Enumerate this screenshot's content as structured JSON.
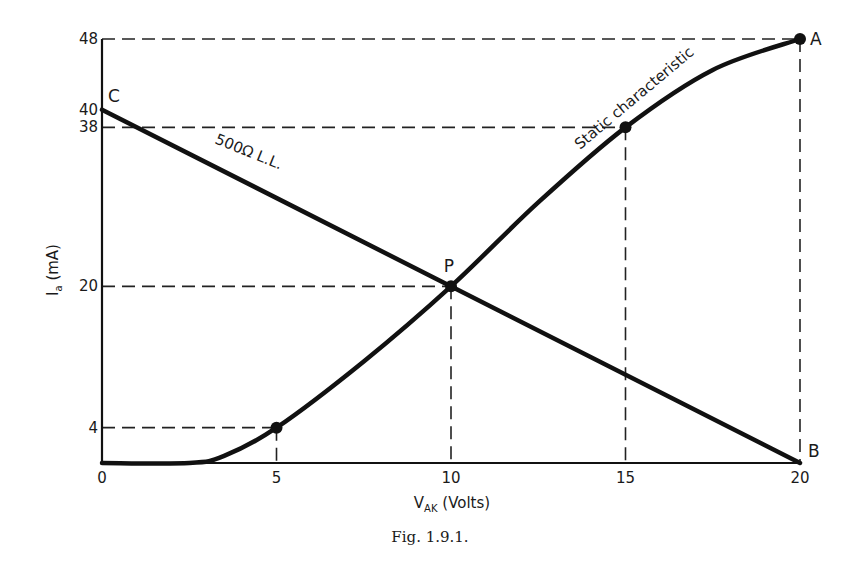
{
  "chart_data": {
    "type": "line",
    "title": "",
    "caption": "Fig. 1.9.1.",
    "xlabel": {
      "main": "V",
      "sub": "AK",
      "unit": " (Volts)"
    },
    "ylabel": {
      "main": "I",
      "sub": "a",
      "unit": " (mA)"
    },
    "xlim": [
      0,
      20
    ],
    "ylim": [
      0,
      48
    ],
    "grid": false,
    "x_ticks": [
      0,
      5,
      10,
      15,
      20
    ],
    "y_ticks": [
      4,
      20,
      38,
      40,
      48
    ],
    "series": [
      {
        "name": "Static characteristic",
        "label": "Static characteristic",
        "x": [
          0,
          2.5,
          3.5,
          5,
          7.5,
          10,
          12.5,
          15,
          17.5,
          20
        ],
        "y": [
          0,
          0,
          0.8,
          4,
          11.5,
          20,
          29.5,
          38,
          44.5,
          48
        ]
      },
      {
        "name": "Load line",
        "label": "500Ω L.L.",
        "x": [
          0,
          20
        ],
        "y": [
          40,
          0
        ]
      }
    ],
    "marked_points": [
      {
        "x": 5,
        "y": 4,
        "label": ""
      },
      {
        "x": 10,
        "y": 20,
        "label": "P"
      },
      {
        "x": 15,
        "y": 38,
        "label": ""
      },
      {
        "x": 20,
        "y": 48,
        "label": "A"
      }
    ],
    "point_labels": [
      {
        "x": 0,
        "y": 40,
        "label": "C"
      },
      {
        "x": 20,
        "y": 0,
        "label": "B"
      }
    ],
    "guide_lines": [
      {
        "x": 5,
        "y": 4
      },
      {
        "x": 10,
        "y": 20
      },
      {
        "x": 15,
        "y": 38
      },
      {
        "x": 20,
        "y": 48
      }
    ]
  }
}
